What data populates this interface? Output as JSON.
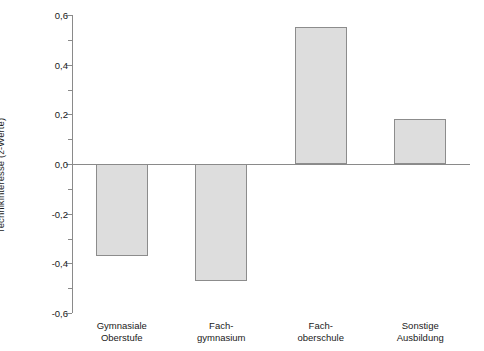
{
  "chart_data": {
    "type": "bar",
    "title": "",
    "subtitle": "",
    "xlabel": "",
    "ylabel": "Technikinteresse (z-Werte)",
    "categories": [
      "Gymnasiale\nOberstufe",
      "Fach-\ngymnasium",
      "Fach-\noberschule",
      "Sonstige\nAusbildung"
    ],
    "values": [
      -0.37,
      -0.47,
      0.55,
      0.18
    ],
    "ylim": [
      -0.6,
      0.6
    ],
    "ytick_values": [
      0.6,
      0.4,
      0.2,
      0.0,
      -0.2,
      -0.4,
      -0.6
    ],
    "ytick_labels": [
      "0,6",
      "0,4",
      "0,2",
      "0,0",
      "-0,2",
      "-0,4",
      "-0,6"
    ],
    "yminor_values": [
      0.5,
      0.3,
      0.1,
      -0.1,
      -0.3,
      -0.5
    ],
    "grid": false,
    "legend": null,
    "legend_position": "none",
    "series": [
      {
        "name": "Technikinteresse",
        "values": [
          -0.37,
          -0.47,
          0.55,
          0.18
        ]
      }
    ],
    "colors": {
      "bar_fill": "#dddddd",
      "bar_border": "#8c8c8c",
      "axis": "#8a8a8a",
      "text": "#1a1a1a",
      "background": "#ffffff"
    }
  }
}
